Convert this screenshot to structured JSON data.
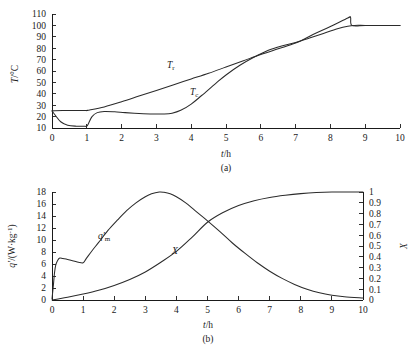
{
  "figure": {
    "panels": [
      {
        "caption": "(a)",
        "xlabel_var": "t",
        "xlabel_unit": "h",
        "ylabel_var": "T",
        "ylabel_unit": "°C"
      },
      {
        "caption": "(b)",
        "xlabel_var": "t",
        "xlabel_unit": "h",
        "ylabel_left_var": "q'",
        "ylabel_left_unit": "(W·kg⁻¹)",
        "ylabel_right_var": "X"
      }
    ]
  },
  "chart_data": [
    {
      "type": "line",
      "title": "",
      "caption": "(a)",
      "xlabel": "t/h",
      "ylabel": "T/°C",
      "xlim": [
        0,
        10
      ],
      "ylim": [
        10,
        110
      ],
      "xticks": [
        0,
        1,
        2,
        3,
        4,
        5,
        6,
        7,
        8,
        9,
        10
      ],
      "yticks": [
        10,
        20,
        30,
        40,
        50,
        60,
        70,
        80,
        90,
        100,
        110
      ],
      "grid": false,
      "legend": "inline-labels",
      "series": [
        {
          "name": "T_r",
          "label": "Tr",
          "x": [
            0.0,
            0.08,
            0.3,
            0.6,
            1.0,
            1.02,
            1.5,
            2.0,
            2.5,
            3.0,
            3.5,
            4.0,
            4.5,
            5.0,
            5.5,
            6.0,
            6.5,
            7.0,
            7.5,
            8.0,
            8.5,
            8.58,
            8.62,
            9.0,
            9.5,
            10.0
          ],
          "y": [
            25.0,
            25.2,
            25.3,
            25.3,
            25.4,
            25.5,
            28.5,
            33.0,
            38.0,
            43.0,
            48.0,
            53.0,
            58.0,
            63.5,
            69.0,
            74.5,
            79.5,
            84.5,
            92.0,
            99.0,
            106.5,
            107.0,
            100.0,
            100.0,
            100.0,
            100.0
          ]
        },
        {
          "name": "T_c",
          "label": "Tc",
          "x": [
            0.0,
            0.1,
            0.25,
            0.45,
            0.7,
            0.95,
            1.0,
            1.05,
            1.15,
            1.3,
            1.5,
            1.8,
            2.1,
            2.5,
            2.9,
            3.2,
            3.45,
            3.7,
            4.0,
            4.3,
            4.7,
            5.0,
            5.4,
            5.8,
            6.2,
            6.6,
            7.0,
            7.4,
            7.8,
            8.2,
            8.5,
            8.7,
            9.0,
            9.5,
            10.0
          ],
          "y": [
            25.0,
            21.0,
            15.5,
            12.5,
            11.6,
            11.5,
            11.6,
            14.0,
            20.0,
            23.5,
            24.5,
            24.2,
            23.5,
            22.8,
            22.3,
            22.3,
            23.0,
            25.5,
            31.0,
            38.5,
            49.0,
            56.5,
            65.0,
            72.0,
            78.0,
            82.0,
            85.0,
            89.0,
            93.0,
            97.0,
            99.3,
            100.0,
            100.0,
            100.0,
            100.0
          ]
        }
      ],
      "annotations": [
        {
          "text": "Tr",
          "x": 4.05,
          "y": 60
        },
        {
          "text": "Tc",
          "x": 4.75,
          "y": 36
        }
      ]
    },
    {
      "type": "line",
      "title": "",
      "caption": "(b)",
      "xlabel": "t/h",
      "ylabel_left": "q'/(W·kg⁻¹)",
      "ylabel_right": "X",
      "xlim": [
        0,
        10
      ],
      "ylim_left": [
        0,
        18
      ],
      "ylim_right": [
        0,
        1
      ],
      "xticks": [
        0,
        1,
        2,
        3,
        4,
        5,
        6,
        7,
        8,
        9,
        10
      ],
      "yticks_left": [
        0,
        2,
        4,
        6,
        8,
        10,
        12,
        14,
        16,
        18
      ],
      "yticks_right": [
        0,
        0.1,
        0.2,
        0.3,
        0.4,
        0.5,
        0.6,
        0.7,
        0.8,
        0.9,
        1
      ],
      "grid": false,
      "legend": "inline-labels",
      "series": [
        {
          "name": "q'_m",
          "label": "q'm",
          "axis": "left",
          "x": [
            0.0,
            0.04,
            0.08,
            0.12,
            0.18,
            0.25,
            0.35,
            0.5,
            0.7,
            0.85,
            1.0,
            1.1,
            1.3,
            1.5,
            1.8,
            2.1,
            2.4,
            2.7,
            3.0,
            3.2,
            3.45,
            3.6,
            3.8,
            4.0,
            4.3,
            4.6,
            5.0,
            5.4,
            5.8,
            6.2,
            6.6,
            7.0,
            7.4,
            7.8,
            8.2,
            8.6,
            9.0,
            9.4,
            10.0
          ],
          "y": [
            0.2,
            2.2,
            4.5,
            5.8,
            6.6,
            7.0,
            6.9,
            6.75,
            6.5,
            6.3,
            6.2,
            6.9,
            8.3,
            9.6,
            11.6,
            13.3,
            14.9,
            16.2,
            17.2,
            17.7,
            18.0,
            17.95,
            17.7,
            17.2,
            16.2,
            14.9,
            13.2,
            11.4,
            9.5,
            7.8,
            6.2,
            4.8,
            3.6,
            2.6,
            1.8,
            1.2,
            0.8,
            0.55,
            0.35
          ]
        },
        {
          "name": "X",
          "label": "X",
          "axis": "right",
          "x": [
            0.0,
            0.2,
            0.5,
            1.0,
            1.5,
            2.0,
            2.5,
            3.0,
            3.5,
            4.0,
            4.5,
            5.0,
            5.5,
            6.0,
            6.5,
            7.0,
            7.5,
            8.0,
            8.5,
            9.0,
            9.5,
            10.0
          ],
          "y": [
            0.0,
            0.01,
            0.025,
            0.055,
            0.09,
            0.135,
            0.19,
            0.26,
            0.35,
            0.45,
            0.58,
            0.72,
            0.81,
            0.875,
            0.92,
            0.95,
            0.97,
            0.985,
            0.995,
            1.0,
            1.0,
            1.0
          ]
        }
      ],
      "annotations": [
        {
          "text": "q'm",
          "x": 2.2,
          "y": 13.2
        },
        {
          "text": "X",
          "x": 4.25,
          "y": 7.2
        }
      ]
    }
  ]
}
